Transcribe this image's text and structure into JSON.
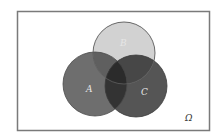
{
  "diagram": {
    "type": "venn",
    "universe": {
      "label": "Ω",
      "frame_color": "#7a7a7a",
      "background": "#ffffff"
    },
    "sets": [
      {
        "id": "A",
        "label": "A",
        "fill": "#6e6e6e",
        "stroke": "#4a4a4a"
      },
      {
        "id": "B",
        "label": "B",
        "fill": "#d2d2d2",
        "stroke": "#6a6a6a"
      },
      {
        "id": "C",
        "label": "C",
        "fill": "#555555",
        "stroke": "#3c3c3c"
      }
    ],
    "overlaps": {
      "A_C": "#2f2f2f",
      "B_C": "#474747",
      "A_B": "#5c5c5c"
    }
  }
}
